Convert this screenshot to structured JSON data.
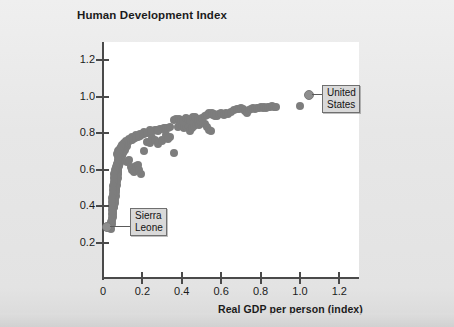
{
  "chart_data": {
    "type": "scatter",
    "title": "Human Development Index",
    "xlabel": "Real GDP per person (index)",
    "ylabel": "Human Development Index",
    "xlim": [
      0,
      1.3
    ],
    "ylim": [
      0,
      1.3
    ],
    "xticks": [
      "0",
      "0.2",
      "0.4",
      "0.6",
      "0.8",
      "1.0",
      "1.2"
    ],
    "xtick_values": [
      0,
      0.2,
      0.4,
      0.6,
      0.8,
      1.0,
      1.2
    ],
    "yticks": [
      "0.2",
      "0.4",
      "0.6",
      "0.8",
      "1.0",
      "1.2"
    ],
    "ytick_values": [
      0.2,
      0.4,
      0.6,
      0.8,
      1.0,
      1.2
    ],
    "grid": false,
    "legend": null,
    "marker_color": "#7d7d7d",
    "marker_size_px": 8,
    "points": [
      [
        0.04,
        0.275
      ],
      [
        0.045,
        0.3
      ],
      [
        0.048,
        0.32
      ],
      [
        0.05,
        0.34
      ],
      [
        0.05,
        0.355
      ],
      [
        0.052,
        0.368
      ],
      [
        0.053,
        0.382
      ],
      [
        0.055,
        0.395
      ],
      [
        0.055,
        0.408
      ],
      [
        0.056,
        0.418
      ],
      [
        0.058,
        0.428
      ],
      [
        0.058,
        0.44
      ],
      [
        0.06,
        0.45
      ],
      [
        0.06,
        0.462
      ],
      [
        0.062,
        0.472
      ],
      [
        0.063,
        0.482
      ],
      [
        0.064,
        0.492
      ],
      [
        0.065,
        0.5
      ],
      [
        0.066,
        0.512
      ],
      [
        0.068,
        0.522
      ],
      [
        0.068,
        0.533
      ],
      [
        0.07,
        0.542
      ],
      [
        0.07,
        0.552
      ],
      [
        0.072,
        0.56
      ],
      [
        0.073,
        0.57
      ],
      [
        0.074,
        0.58
      ],
      [
        0.076,
        0.59
      ],
      [
        0.077,
        0.6
      ],
      [
        0.078,
        0.61
      ],
      [
        0.08,
        0.618
      ],
      [
        0.082,
        0.628
      ],
      [
        0.084,
        0.637
      ],
      [
        0.086,
        0.645
      ],
      [
        0.088,
        0.652
      ],
      [
        0.09,
        0.66
      ],
      [
        0.092,
        0.668
      ],
      [
        0.095,
        0.675
      ],
      [
        0.098,
        0.682
      ],
      [
        0.1,
        0.69
      ],
      [
        0.103,
        0.697
      ],
      [
        0.106,
        0.703
      ],
      [
        0.11,
        0.71
      ],
      [
        0.114,
        0.716
      ],
      [
        0.118,
        0.722
      ],
      [
        0.122,
        0.727
      ],
      [
        0.058,
        0.395
      ],
      [
        0.06,
        0.415
      ],
      [
        0.062,
        0.435
      ],
      [
        0.064,
        0.455
      ],
      [
        0.066,
        0.475
      ],
      [
        0.068,
        0.495
      ],
      [
        0.07,
        0.515
      ],
      [
        0.072,
        0.535
      ],
      [
        0.075,
        0.555
      ],
      [
        0.078,
        0.575
      ],
      [
        0.066,
        0.598
      ],
      [
        0.07,
        0.628
      ],
      [
        0.074,
        0.648
      ],
      [
        0.08,
        0.665
      ],
      [
        0.086,
        0.678
      ],
      [
        0.072,
        0.688
      ],
      [
        0.076,
        0.7
      ],
      [
        0.08,
        0.706
      ],
      [
        0.084,
        0.712
      ],
      [
        0.09,
        0.718
      ],
      [
        0.095,
        0.724
      ],
      [
        0.1,
        0.73
      ],
      [
        0.105,
        0.736
      ],
      [
        0.11,
        0.742
      ],
      [
        0.116,
        0.746
      ],
      [
        0.122,
        0.75
      ],
      [
        0.128,
        0.754
      ],
      [
        0.134,
        0.758
      ],
      [
        0.14,
        0.76
      ],
      [
        0.146,
        0.764
      ],
      [
        0.152,
        0.768
      ],
      [
        0.158,
        0.772
      ],
      [
        0.164,
        0.774
      ],
      [
        0.17,
        0.778
      ],
      [
        0.176,
        0.78
      ],
      [
        0.182,
        0.784
      ],
      [
        0.188,
        0.787
      ],
      [
        0.194,
        0.79
      ],
      [
        0.2,
        0.793
      ],
      [
        0.208,
        0.796
      ],
      [
        0.216,
        0.8
      ],
      [
        0.224,
        0.802
      ],
      [
        0.232,
        0.805
      ],
      [
        0.24,
        0.808
      ],
      [
        0.248,
        0.81
      ],
      [
        0.256,
        0.812
      ],
      [
        0.264,
        0.815
      ],
      [
        0.272,
        0.818
      ],
      [
        0.28,
        0.82
      ],
      [
        0.29,
        0.822
      ],
      [
        0.3,
        0.824
      ],
      [
        0.31,
        0.826
      ],
      [
        0.32,
        0.828
      ],
      [
        0.33,
        0.83
      ],
      [
        0.34,
        0.832
      ],
      [
        0.12,
        0.64
      ],
      [
        0.13,
        0.655
      ],
      [
        0.14,
        0.612
      ],
      [
        0.148,
        0.6
      ],
      [
        0.155,
        0.586
      ],
      [
        0.17,
        0.622
      ],
      [
        0.18,
        0.628
      ],
      [
        0.185,
        0.598
      ],
      [
        0.195,
        0.578
      ],
      [
        0.21,
        0.7
      ],
      [
        0.225,
        0.752
      ],
      [
        0.24,
        0.746
      ],
      [
        0.25,
        0.772
      ],
      [
        0.265,
        0.76
      ],
      [
        0.28,
        0.742
      ],
      [
        0.3,
        0.756
      ],
      [
        0.32,
        0.792
      ],
      [
        0.34,
        0.78
      ],
      [
        0.36,
        0.69
      ],
      [
        0.38,
        0.836
      ],
      [
        0.39,
        0.848
      ],
      [
        0.4,
        0.842
      ],
      [
        0.41,
        0.828
      ],
      [
        0.42,
        0.838
      ],
      [
        0.43,
        0.845
      ],
      [
        0.44,
        0.812
      ],
      [
        0.45,
        0.828
      ],
      [
        0.46,
        0.84
      ],
      [
        0.47,
        0.85
      ],
      [
        0.48,
        0.856
      ],
      [
        0.49,
        0.846
      ],
      [
        0.5,
        0.862
      ],
      [
        0.51,
        0.856
      ],
      [
        0.52,
        0.848
      ],
      [
        0.53,
        0.836
      ],
      [
        0.54,
        0.82
      ],
      [
        0.55,
        0.812
      ],
      [
        0.56,
        0.9
      ],
      [
        0.57,
        0.896
      ],
      [
        0.58,
        0.892
      ],
      [
        0.36,
        0.87
      ],
      [
        0.372,
        0.878
      ],
      [
        0.384,
        0.88
      ],
      [
        0.396,
        0.874
      ],
      [
        0.408,
        0.868
      ],
      [
        0.42,
        0.884
      ],
      [
        0.432,
        0.88
      ],
      [
        0.444,
        0.87
      ],
      [
        0.456,
        0.886
      ],
      [
        0.468,
        0.89
      ],
      [
        0.48,
        0.878
      ],
      [
        0.492,
        0.872
      ],
      [
        0.504,
        0.884
      ],
      [
        0.516,
        0.896
      ],
      [
        0.528,
        0.902
      ],
      [
        0.54,
        0.908
      ],
      [
        0.552,
        0.912
      ],
      [
        0.564,
        0.906
      ],
      [
        0.576,
        0.898
      ],
      [
        0.59,
        0.904
      ],
      [
        0.6,
        0.908
      ],
      [
        0.612,
        0.902
      ],
      [
        0.624,
        0.91
      ],
      [
        0.636,
        0.906
      ],
      [
        0.65,
        0.914
      ],
      [
        0.665,
        0.928
      ],
      [
        0.68,
        0.934
      ],
      [
        0.69,
        0.93
      ],
      [
        0.7,
        0.936
      ],
      [
        0.71,
        0.932
      ],
      [
        0.72,
        0.92
      ],
      [
        0.73,
        0.908
      ],
      [
        0.74,
        0.926
      ],
      [
        0.75,
        0.934
      ],
      [
        0.76,
        0.938
      ],
      [
        0.77,
        0.934
      ],
      [
        0.78,
        0.94
      ],
      [
        0.79,
        0.936
      ],
      [
        0.8,
        0.942
      ],
      [
        0.81,
        0.938
      ],
      [
        0.82,
        0.944
      ],
      [
        0.83,
        0.94
      ],
      [
        0.84,
        0.946
      ],
      [
        0.85,
        0.942
      ],
      [
        0.86,
        0.948
      ],
      [
        0.87,
        0.944
      ],
      [
        0.88,
        0.946
      ],
      [
        0.3,
        0.76
      ],
      [
        0.33,
        0.77
      ],
      [
        0.28,
        0.812
      ],
      [
        0.24,
        0.82
      ],
      [
        0.21,
        0.806
      ],
      [
        0.19,
        0.796
      ],
      [
        0.166,
        0.788
      ],
      [
        0.148,
        0.778
      ],
      [
        0.132,
        0.766
      ],
      [
        0.118,
        0.756
      ],
      [
        0.106,
        0.744
      ],
      [
        0.096,
        0.734
      ],
      [
        0.09,
        0.722
      ],
      [
        0.086,
        0.704
      ],
      [
        0.082,
        0.686
      ],
      [
        0.078,
        0.668
      ],
      [
        0.074,
        0.65
      ],
      [
        0.07,
        0.632
      ],
      [
        0.066,
        0.614
      ],
      [
        0.062,
        0.596
      ],
      [
        0.058,
        0.578
      ],
      [
        0.056,
        0.556
      ],
      [
        0.054,
        0.534
      ],
      [
        0.052,
        0.512
      ],
      [
        0.05,
        0.49
      ],
      [
        0.049,
        0.468
      ],
      [
        0.048,
        0.446
      ],
      [
        0.047,
        0.424
      ],
      [
        0.046,
        0.402
      ],
      [
        0.045,
        0.38
      ],
      [
        0.044,
        0.358
      ],
      [
        0.044,
        0.336
      ],
      [
        0.043,
        0.314
      ],
      [
        1.0,
        0.95
      ]
    ],
    "annotations": [
      {
        "label": "United States",
        "label_lines": [
          "United",
          "States"
        ],
        "x": 1.0,
        "y": 0.95
      },
      {
        "label": "Sierra Leone",
        "label_lines": [
          "Sierra",
          "Leone"
        ],
        "x": 0.04,
        "y": 0.275
      }
    ]
  }
}
